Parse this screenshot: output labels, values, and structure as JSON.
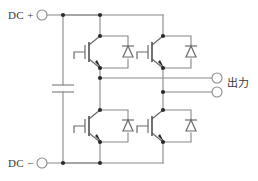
{
  "diagram": {
    "type": "schematic",
    "background_color": "#ffffff",
    "wire_color": "#888888",
    "device_color": "#6a6a6a",
    "node_color": "#2b2b2b"
  },
  "labels": {
    "dc_positive": "DC +",
    "dc_negative": "DC −",
    "output": "出力"
  },
  "terminals": [
    {
      "id": "dc-plus",
      "label": "DC +",
      "cx": 42,
      "cy": 15,
      "r": 5
    },
    {
      "id": "dc-minus",
      "label": "DC −",
      "cx": 42,
      "cy": 163,
      "r": 5
    },
    {
      "id": "output-top",
      "label": "",
      "cx": 217,
      "cy": 78,
      "r": 5
    },
    {
      "id": "output-bot",
      "label": "",
      "cx": 217,
      "cy": 92,
      "r": 5
    }
  ],
  "components": {
    "capacitor": {
      "name": "dc-link-capacitor",
      "x": 63,
      "plate_top_y": 85,
      "plate_bot_y": 92,
      "plate_half_width": 11
    },
    "switches": [
      {
        "id": "igbt-q1",
        "position": "upper-left",
        "leg": "left",
        "arm": "upper"
      },
      {
        "id": "igbt-q2",
        "position": "upper-right",
        "leg": "right",
        "arm": "upper"
      },
      {
        "id": "igbt-q3",
        "position": "lower-left",
        "leg": "left",
        "arm": "lower"
      },
      {
        "id": "igbt-q4",
        "position": "lower-right",
        "leg": "right",
        "arm": "lower"
      }
    ],
    "diodes": [
      {
        "id": "diode-d1",
        "paired_with": "igbt-q1",
        "orientation": "cathode-up"
      },
      {
        "id": "diode-d2",
        "paired_with": "igbt-q2",
        "orientation": "cathode-up"
      },
      {
        "id": "diode-d3",
        "paired_with": "igbt-q3",
        "orientation": "cathode-up"
      },
      {
        "id": "diode-d4",
        "paired_with": "igbt-q4",
        "orientation": "cathode-up"
      }
    ]
  },
  "rails": {
    "positive_rail_y": 15,
    "negative_rail_y": 163,
    "left_leg_x": 100,
    "right_leg_x": 163,
    "output_top_y": 78,
    "output_bot_y": 92
  },
  "junctions": [
    {
      "x": 63,
      "y": 15
    },
    {
      "x": 100,
      "y": 15
    },
    {
      "x": 63,
      "y": 163
    },
    {
      "x": 100,
      "y": 163
    },
    {
      "x": 100,
      "y": 78
    },
    {
      "x": 163,
      "y": 92
    },
    {
      "x": 100,
      "y": 36
    },
    {
      "x": 100,
      "y": 68
    },
    {
      "x": 163,
      "y": 36
    },
    {
      "x": 163,
      "y": 68
    },
    {
      "x": 100,
      "y": 110
    },
    {
      "x": 100,
      "y": 142
    },
    {
      "x": 163,
      "y": 110
    },
    {
      "x": 163,
      "y": 142
    }
  ]
}
